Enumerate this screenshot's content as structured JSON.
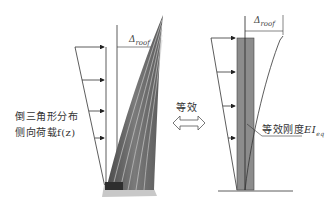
{
  "figure": {
    "left_panel": {
      "title": "Actual tower under lateral load",
      "load_label_line1": "倒三角形分布",
      "load_label_line2": "侧向荷载f(z)",
      "displacement_symbol": "Δ",
      "displacement_subscript": "roof",
      "arrow_count": 4
    },
    "center": {
      "equivalence_label": "等效",
      "arrow_icon": "double-arrow-icon"
    },
    "right_panel": {
      "title": "Equivalent cantilever",
      "displacement_symbol": "Δ",
      "displacement_subscript": "roof",
      "stiffness_label": "等效刚度",
      "stiffness_symbol": "EI",
      "stiffness_subscript": "eq",
      "arrow_count": 4
    },
    "colors": {
      "line": "#333333",
      "column_fill": "#8c8c8c",
      "tower_dark": "#5a5a5a",
      "tower_light": "#bdbdbd",
      "base_plate": "#c8c8c8"
    }
  }
}
